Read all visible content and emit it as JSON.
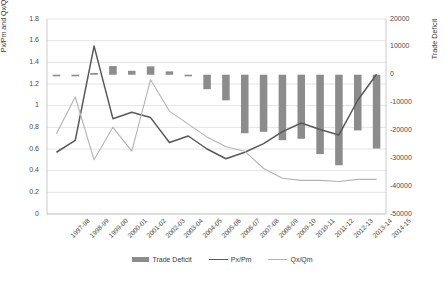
{
  "chart_data": {
    "type": "bar",
    "title": "",
    "xlabel": "",
    "ylabel": "Px/Pm and Qx/Qm",
    "ylabel_secondary": "Trade Deficit",
    "grid": true,
    "legend_position": "bottom",
    "ylim": [
      0,
      1.8
    ],
    "ylim_secondary": [
      -50000,
      20000
    ],
    "yticks": [
      "0",
      "0.2",
      "0.4",
      "0.6",
      "0.8",
      "1",
      "1.2",
      "1.4",
      "1.6",
      "1.8"
    ],
    "ytick_values": [
      0,
      0.2,
      0.4,
      0.6,
      0.8,
      1.0,
      1.2,
      1.4,
      1.6,
      1.8
    ],
    "yticks_secondary": [
      "-50000",
      "-40000",
      "-30000",
      "-20000",
      "-10000",
      "0",
      "10000",
      "20000"
    ],
    "ytick_values_secondary": [
      -50000,
      -40000,
      -30000,
      -20000,
      -10000,
      0,
      10000,
      20000
    ],
    "categories": [
      "1997-98",
      "1998-99",
      "1999-00",
      "2000-01",
      "2001-02",
      "2002-03",
      "2003-04",
      "2004-05",
      "2005-06",
      "2006-07",
      "2007-08",
      "2008-09",
      "2009-10",
      "2010-11",
      "2011-12",
      "2012-13",
      "2013-14",
      "2014-15"
    ],
    "series": [
      {
        "name": "Trade Deficit",
        "type": "bar",
        "axis": "secondary",
        "color": "#8c8c8c",
        "values": [
          -300,
          -500,
          600,
          3100,
          1400,
          3000,
          1200,
          -200,
          -5200,
          -9200,
          -21000,
          -20500,
          -23500,
          -23000,
          -28500,
          -32500,
          -20000,
          -26500
        ]
      },
      {
        "name": "Px/Pm",
        "type": "line",
        "axis": "primary",
        "color": "#595959",
        "values": [
          0.57,
          0.68,
          1.55,
          0.88,
          0.94,
          0.89,
          0.66,
          0.72,
          0.6,
          0.51,
          0.57,
          0.65,
          0.76,
          0.84,
          0.78,
          0.73,
          1.05,
          1.29
        ]
      },
      {
        "name": "Qx/Qm",
        "type": "line",
        "axis": "primary",
        "color": "#b3b3b3",
        "values": [
          0.74,
          1.08,
          0.5,
          0.8,
          0.58,
          1.24,
          0.95,
          0.83,
          0.71,
          0.62,
          0.58,
          0.42,
          0.33,
          0.31,
          0.31,
          0.3,
          0.32,
          0.32
        ]
      }
    ],
    "legend": [
      "Trade Deficit",
      "Px/Pm",
      "Qx/Qm"
    ],
    "colors": {
      "bar": "#8c8c8c",
      "line_primary": "#595959",
      "line_secondary": "#b3b3b3",
      "grid": "#d9d9d9",
      "axis": "#bfbfbf",
      "text": "#404040"
    }
  }
}
